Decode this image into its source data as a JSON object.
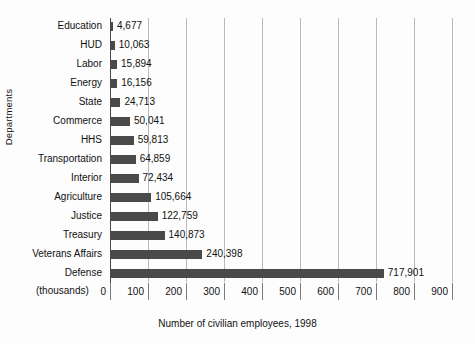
{
  "chart_data": {
    "type": "bar",
    "orientation": "horizontal",
    "title": "",
    "xlabel": "Number of civilian employees, 1998",
    "ylabel": "Departments",
    "units_note": "(thousands)",
    "xlim": [
      0,
      900
    ],
    "xticks": [
      0,
      100,
      200,
      300,
      400,
      500,
      600,
      700,
      800,
      900
    ],
    "xtick_labels": [
      "0",
      "100",
      "200",
      "300",
      "400",
      "500",
      "600",
      "700",
      "800",
      "900"
    ],
    "grid": true,
    "legend": false,
    "bar_color": "#4a4a4a",
    "gridline_color": "#b9b9b9",
    "axis_color": "#4a4a4a",
    "categories": [
      "Education",
      "HUD",
      "Labor",
      "Energy",
      "State",
      "Commerce",
      "HHS",
      "Transportation",
      "Interior",
      "Agriculture",
      "Justice",
      "Treasury",
      "Veterans Affairs",
      "Defense"
    ],
    "values": [
      4677,
      10063,
      15894,
      16156,
      24713,
      50041,
      59813,
      64859,
      72434,
      105664,
      122759,
      140873,
      240398,
      717901
    ],
    "value_labels": [
      "4,677",
      "10,063",
      "15,894",
      "16,156",
      "24,713",
      "50,041",
      "59,813",
      "64,859",
      "72,434",
      "105,664",
      "122,759",
      "140,873",
      "240,398",
      "717,901"
    ]
  }
}
